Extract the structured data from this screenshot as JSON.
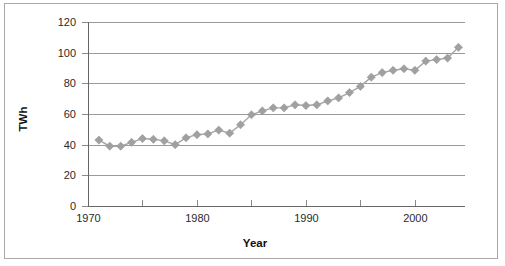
{
  "chart_data": {
    "type": "line",
    "title": "",
    "xlabel": "Year",
    "ylabel": "TWh",
    "xlim": [
      1970,
      2004
    ],
    "ylim": [
      0,
      120
    ],
    "ytick_values": [
      0,
      20,
      40,
      60,
      80,
      100,
      120
    ],
    "ytick_labels": [
      "0",
      "20",
      "40",
      "60",
      "80",
      "100",
      "120"
    ],
    "xtick_values": [
      1970,
      1975,
      1980,
      1985,
      1990,
      1995,
      2000
    ],
    "xtick_labels": [
      "1970",
      "",
      "1980",
      "",
      "1990",
      "",
      "2000"
    ],
    "grid": "horizontal",
    "legend": "none",
    "marker": "diamond",
    "marker_color": "#a0a0a0",
    "line_color": "#a6a6a6",
    "x": [
      1971,
      1972,
      1973,
      1974,
      1975,
      1976,
      1977,
      1978,
      1979,
      1980,
      1981,
      1982,
      1983,
      1984,
      1985,
      1986,
      1987,
      1988,
      1989,
      1990,
      1991,
      1992,
      1993,
      1994,
      1995,
      1996,
      1997,
      1998,
      1999,
      2000,
      2001,
      2002,
      2003,
      2004
    ],
    "values": [
      43,
      39,
      39,
      41.5,
      44,
      43.5,
      42.5,
      40,
      44.5,
      46.5,
      47,
      49.5,
      47.5,
      53,
      59.5,
      62,
      64,
      64,
      66,
      65.5,
      66,
      68.5,
      70.5,
      74,
      78,
      84,
      87,
      88.5,
      89.5,
      88.5,
      94.5,
      95.5,
      96.5,
      103.5
    ],
    "series": [
      {
        "name": "TWh",
        "values": [
          43,
          39,
          39,
          41.5,
          44,
          43.5,
          42.5,
          40,
          44.5,
          46.5,
          47,
          49.5,
          47.5,
          53,
          59.5,
          62,
          64,
          64,
          66,
          65.5,
          66,
          68.5,
          70.5,
          74,
          78,
          84,
          87,
          88.5,
          89.5,
          88.5,
          94.5,
          95.5,
          96.5,
          103.5
        ]
      }
    ]
  }
}
